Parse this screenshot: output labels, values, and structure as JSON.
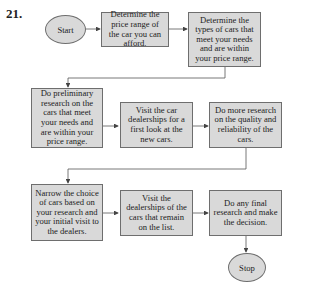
{
  "problem_number": "21.",
  "flowchart": {
    "start": "Start",
    "stop": "Stop",
    "steps": [
      "Determine the price range of the car you can afford.",
      "Determine the types of cars that meet your needs and are within your price range.",
      "Do preliminary research on the cars that meet your needs and are within your price range.",
      "Visit the car dealerships for a first look at the new cars.",
      "Do more research on the quality and reliability of the cars.",
      "Narrow the choice of cars based on your research and your initial visit to the dealers.",
      "Visit the dealerships of the cars that remain on the list.",
      "Do any final research and make the decision."
    ]
  },
  "colors": {
    "box_fill": "#d9d9d9",
    "box_border": "#6e6e6e",
    "arrow": "#444444"
  }
}
